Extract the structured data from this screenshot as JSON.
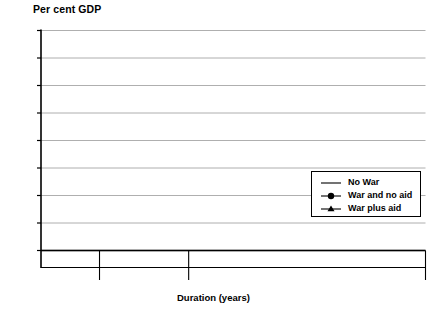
{
  "chart_data": {
    "type": "line",
    "title": "",
    "ylabel": "Per cent GDP",
    "xlabel": "Duration (years)",
    "ylim": [
      0.6,
      1.4
    ],
    "yticks": [
      "0.6",
      "0.7",
      "0.8",
      "0.9",
      "1.0",
      "1.1",
      "1.2",
      "1.3",
      "1.4"
    ],
    "ytick_values": [
      0.6,
      0.7,
      0.8,
      0.9,
      1.0,
      1.1,
      1.2,
      1.3,
      1.4
    ],
    "grid": true,
    "legend_position": "inside-lower-right",
    "phases": [
      {
        "name": "Peace",
        "ticks": [
          "0",
          "1",
          "2",
          "3",
          "4"
        ]
      },
      {
        "name": "War",
        "ticks": [
          "0",
          "1",
          "2",
          "3",
          "4",
          "5",
          "6",
          "7"
        ]
      },
      {
        "name": "Postwar",
        "ticks": [
          "0",
          "1",
          "2",
          "3",
          "4",
          "5",
          "6",
          "7",
          "8",
          "9",
          "10",
          "11",
          "12",
          "13",
          "14",
          "15",
          "16",
          "17",
          "18",
          "19",
          "20"
        ]
      }
    ],
    "series": [
      {
        "name": "No War",
        "marker": "none",
        "color": "#000000",
        "values": [
          1.0,
          1.0,
          1.0,
          1.0,
          1.0,
          1.0,
          1.0038,
          1.0077,
          1.0115,
          1.0154,
          1.0192,
          1.0231,
          1.0269,
          1.0308,
          1.0346,
          1.0385,
          1.0423,
          1.0462,
          1.05,
          1.0538,
          1.0577,
          1.0615,
          1.0654,
          1.0692,
          1.0731,
          1.0769,
          1.0808,
          1.0846,
          1.0885,
          1.0923,
          1.0962,
          1.1,
          1.1,
          1.1,
          1.1
        ]
      },
      {
        "name": "War and no aid",
        "marker": "circle",
        "color": "#000000",
        "values": [
          0.997,
          0.997,
          0.997,
          0.997,
          0.994,
          1.112,
          1.088,
          1.088,
          1.09,
          1.092,
          1.094,
          1.096,
          1.1,
          1.295,
          1.296,
          1.304,
          1.308,
          1.31,
          1.311,
          1.312,
          1.313,
          1.314,
          1.323,
          1.33,
          1.332,
          1.33,
          1.327,
          1.323,
          1.319,
          1.316,
          1.314,
          1.313,
          1.312,
          1.311,
          1.31
        ]
      },
      {
        "name": "War plus aid",
        "marker": "triangle",
        "color": "#000000",
        "values": [
          0.997,
          0.997,
          0.997,
          0.997,
          0.994,
          1.112,
          1.088,
          1.088,
          1.09,
          1.092,
          1.094,
          1.096,
          1.1,
          1.07,
          1.066,
          1.069,
          1.072,
          1.074,
          1.076,
          1.078,
          1.08,
          1.082,
          1.095,
          1.098,
          1.099,
          1.1,
          1.098,
          1.094,
          1.09,
          1.086,
          1.082,
          1.078,
          1.073,
          1.068,
          1.062
        ]
      }
    ]
  },
  "legend": {
    "items": [
      {
        "label": "No War",
        "marker": "line"
      },
      {
        "label": "War and no aid",
        "marker": "circle"
      },
      {
        "label": "War plus aid",
        "marker": "triangle"
      }
    ]
  }
}
